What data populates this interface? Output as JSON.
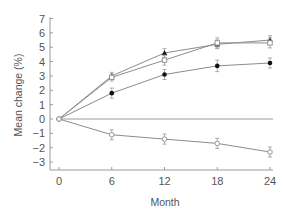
{
  "chart_data": {
    "type": "line",
    "title": "",
    "xlabel": "Month",
    "ylabel": "Mean change (%)",
    "x": [
      0,
      6,
      12,
      18,
      24
    ],
    "x_ticks": [
      "0",
      "6",
      "12",
      "18",
      "24"
    ],
    "y_ticks": [
      "7",
      "6",
      "5",
      "4",
      "3",
      "2",
      "1",
      "0",
      "−1",
      "−2",
      "−3"
    ],
    "xlim": [
      0,
      24
    ],
    "ylim": [
      -3,
      7
    ],
    "grid": false,
    "legend": null,
    "reference_line_y": 0,
    "series": [
      {
        "name": "Series A (filled triangle)",
        "marker": "filled-triangle",
        "values": [
          0,
          3.0,
          4.6,
          5.2,
          5.5
        ],
        "errors": [
          0,
          0.25,
          0.3,
          0.3,
          0.3
        ]
      },
      {
        "name": "Series B (open square)",
        "marker": "open-square",
        "values": [
          0,
          2.9,
          4.1,
          5.3,
          5.3
        ],
        "errors": [
          0,
          0.25,
          0.35,
          0.35,
          0.35
        ]
      },
      {
        "name": "Series C (filled circle)",
        "marker": "filled-circle",
        "values": [
          0,
          1.8,
          3.1,
          3.7,
          3.9
        ],
        "errors": [
          0,
          0.35,
          0.35,
          0.4,
          0.35
        ]
      },
      {
        "name": "Series D (open circle)",
        "marker": "open-circle",
        "values": [
          0,
          -1.1,
          -1.4,
          -1.7,
          -2.3
        ],
        "errors": [
          0,
          0.35,
          0.35,
          0.35,
          0.35
        ]
      }
    ]
  },
  "colors": {
    "axis": "#9a9a9a",
    "line": "#8c8c8c",
    "marker": "#111111",
    "text": "#555555"
  }
}
